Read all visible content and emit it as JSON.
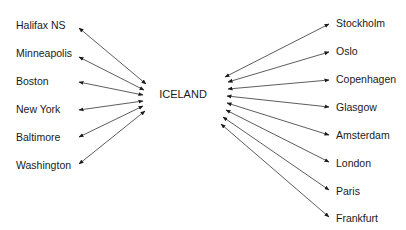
{
  "diagram": {
    "type": "hub-and-spoke",
    "hub": {
      "label": "ICELAND",
      "x": 183,
      "y": 98
    },
    "colors": {
      "line": "#333333",
      "text": "#1a1a1a",
      "background": "#ffffff"
    },
    "left_nodes": [
      {
        "label": "Halifax NS",
        "tx": 16,
        "ty": 29,
        "outer": [
          79,
          28
        ],
        "inner": [
          146,
          84
        ]
      },
      {
        "label": "Minneapolis",
        "tx": 16,
        "ty": 57,
        "outer": [
          79,
          57
        ],
        "inner": [
          144,
          90
        ]
      },
      {
        "label": "Boston",
        "tx": 16,
        "ty": 85,
        "outer": [
          79,
          82
        ],
        "inner": [
          143,
          95
        ]
      },
      {
        "label": "New York",
        "tx": 16,
        "ty": 113,
        "outer": [
          79,
          110
        ],
        "inner": [
          143,
          101
        ]
      },
      {
        "label": "Baltimore",
        "tx": 16,
        "ty": 141,
        "outer": [
          79,
          137
        ],
        "inner": [
          143,
          106
        ]
      },
      {
        "label": "Washington",
        "tx": 16,
        "ty": 169,
        "outer": [
          79,
          164
        ],
        "inner": [
          145,
          111
        ]
      }
    ],
    "right_nodes": [
      {
        "label": "Stockholm",
        "tx": 336,
        "ty": 27,
        "outer": [
          329,
          24
        ],
        "inner": [
          225,
          77
        ]
      },
      {
        "label": "Oslo",
        "tx": 336,
        "ty": 55,
        "outer": [
          329,
          52
        ],
        "inner": [
          228,
          82
        ]
      },
      {
        "label": "Copenhagen",
        "tx": 336,
        "ty": 83,
        "outer": [
          329,
          80
        ],
        "inner": [
          228,
          89
        ]
      },
      {
        "label": "Glasgow",
        "tx": 336,
        "ty": 111,
        "outer": [
          329,
          107
        ],
        "inner": [
          227,
          96
        ]
      },
      {
        "label": "Amsterdam",
        "tx": 336,
        "ty": 139,
        "outer": [
          329,
          135
        ],
        "inner": [
          227,
          103
        ]
      },
      {
        "label": "London",
        "tx": 336,
        "ty": 167,
        "outer": [
          329,
          162
        ],
        "inner": [
          226,
          110
        ]
      },
      {
        "label": "Paris",
        "tx": 336,
        "ty": 195,
        "outer": [
          329,
          190
        ],
        "inner": [
          223,
          117
        ]
      },
      {
        "label": "Frankfurt",
        "tx": 336,
        "ty": 222,
        "outer": [
          329,
          217
        ],
        "inner": [
          221,
          124
        ]
      }
    ]
  }
}
